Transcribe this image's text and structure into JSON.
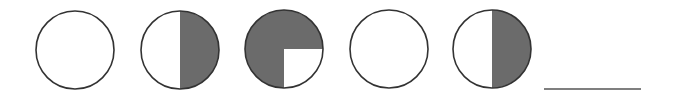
{
  "title": "Fraction circle pattern sequence",
  "colors": {
    "outline": "#333333",
    "fill": "#6b6b6b",
    "background": "#ffffff",
    "answer_line": "#555555"
  },
  "circles": [
    {
      "id": 1,
      "cx": 75,
      "cy": 50,
      "r": 39,
      "shaded": "none",
      "shaded_fraction": "0"
    },
    {
      "id": 2,
      "cx": 180,
      "cy": 50,
      "r": 39,
      "shaded": "right-half",
      "shaded_fraction": "1/2"
    },
    {
      "id": 3,
      "cx": 284,
      "cy": 49,
      "r": 39,
      "shaded": "three-quarters",
      "shaded_fraction": "3/4",
      "unshaded_quadrant": "bottom-right"
    },
    {
      "id": 4,
      "cx": 389,
      "cy": 49,
      "r": 39,
      "shaded": "none",
      "shaded_fraction": "0"
    },
    {
      "id": 5,
      "cx": 492,
      "cy": 49,
      "r": 39,
      "shaded": "right-half",
      "shaded_fraction": "1/2"
    }
  ],
  "answer_blank": {
    "x1": 544,
    "x2": 641,
    "y": 89,
    "label": "answer blank"
  }
}
